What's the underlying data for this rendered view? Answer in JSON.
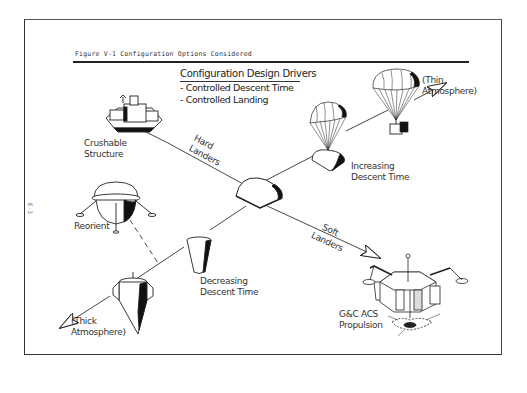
{
  "figure": {
    "title": "Figure V-1    Configuration Options Considered",
    "page_marker": "E-3"
  },
  "drivers": {
    "heading": "Configuration Design Drivers",
    "items": [
      "-  Controlled Descent Time",
      "-  Controlled Landing"
    ]
  },
  "axes": {
    "hard_landers": [
      "Hard",
      "Landers"
    ],
    "soft_landers": [
      "Soft",
      "Landers"
    ],
    "increasing_descent": [
      "Increasing",
      "Descent Time"
    ],
    "decreasing_descent": [
      "Decreasing",
      "Descent Time"
    ]
  },
  "options": {
    "crushable": [
      "Crushable",
      "Structure"
    ],
    "reorient": "Reorient",
    "thin_atmosphere": [
      "(Thin",
      "Atmosphere)"
    ],
    "thick_atmosphere": [
      "(Thick",
      "Atmosphere)"
    ],
    "soft_lander": [
      "G&C ACS",
      "Propulsion"
    ]
  },
  "colors": {
    "ink": "#222222",
    "paper": "#ffffff"
  }
}
